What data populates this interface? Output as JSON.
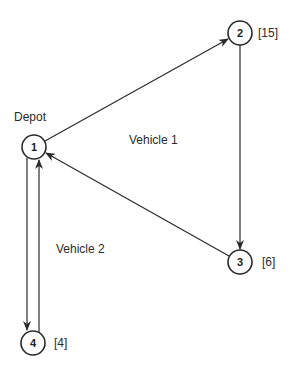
{
  "diagram": {
    "type": "vehicle-routing",
    "depot_label": "Depot",
    "nodes": [
      {
        "id": "1",
        "label": "1",
        "demand": "",
        "role": "depot"
      },
      {
        "id": "2",
        "label": "2",
        "demand": "[15]"
      },
      {
        "id": "3",
        "label": "3",
        "demand": "[6]"
      },
      {
        "id": "4",
        "label": "4",
        "demand": "[4]"
      }
    ],
    "routes": [
      {
        "name": "Vehicle 1",
        "path": [
          "1",
          "2",
          "3",
          "1"
        ]
      },
      {
        "name": "Vehicle 2",
        "path": [
          "1",
          "4",
          "1"
        ]
      }
    ],
    "edges": [
      {
        "from": "1",
        "to": "2",
        "route": "Vehicle 1"
      },
      {
        "from": "2",
        "to": "3",
        "route": "Vehicle 1"
      },
      {
        "from": "3",
        "to": "1",
        "route": "Vehicle 1"
      },
      {
        "from": "1",
        "to": "4",
        "route": "Vehicle 2"
      },
      {
        "from": "4",
        "to": "1",
        "route": "Vehicle 2"
      }
    ],
    "colors": {
      "stroke": "#2a2a2a",
      "background": "#ffffff"
    }
  }
}
